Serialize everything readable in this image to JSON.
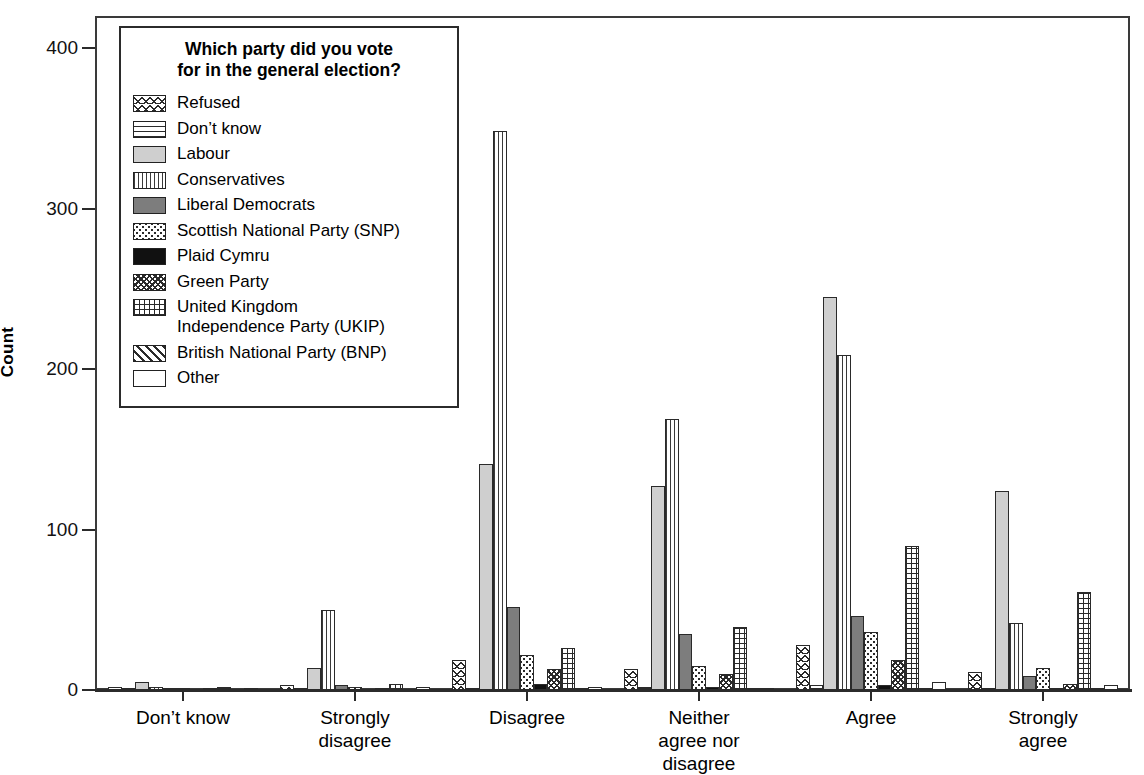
{
  "chart_data": {
    "type": "bar",
    "title": "",
    "xlabel": "",
    "ylabel": "Count",
    "ylim": [
      0,
      420
    ],
    "yticks": [
      0,
      100,
      200,
      300,
      400
    ],
    "grid": false,
    "legend_position": "inside-top-left",
    "legend_title": "Which party did you vote\nfor in the general election?",
    "categories": [
      "Don't know",
      "Strongly\ndisagree",
      "Disagree",
      "Neither\nagree nor\ndisagree",
      "Agree",
      "Strongly\nagree"
    ],
    "series": [
      {
        "name": "Refused",
        "pattern": "p-refused",
        "values": [
          2,
          3,
          19,
          13,
          28,
          11
        ]
      },
      {
        "name": "Don't know",
        "pattern": "p-dontknow",
        "values": [
          1,
          1,
          1,
          2,
          3,
          1
        ]
      },
      {
        "name": "Labour",
        "pattern": "p-labour",
        "values": [
          5,
          14,
          141,
          127,
          245,
          124
        ]
      },
      {
        "name": "Conservatives",
        "pattern": "p-cons",
        "values": [
          2,
          50,
          348,
          169,
          209,
          42
        ]
      },
      {
        "name": "Liberal Democrats",
        "pattern": "p-libdem",
        "values": [
          1,
          3,
          52,
          35,
          46,
          9
        ]
      },
      {
        "name": "Scottish National Party (SNP)",
        "pattern": "p-snp",
        "values": [
          1,
          2,
          22,
          15,
          36,
          14
        ]
      },
      {
        "name": "Plaid Cymru",
        "pattern": "p-plaid",
        "values": [
          0,
          0,
          4,
          2,
          3,
          1
        ]
      },
      {
        "name": "Green Party",
        "pattern": "p-green",
        "values": [
          1,
          1,
          13,
          10,
          19,
          4
        ]
      },
      {
        "name": "United Kingdom\nIndependence Party (UKIP)",
        "pattern": "p-ukip",
        "values": [
          2,
          4,
          26,
          39,
          90,
          61
        ]
      },
      {
        "name": "British National Party (BNP)",
        "pattern": "p-bnp",
        "values": [
          0,
          0,
          1,
          1,
          1,
          1
        ]
      },
      {
        "name": "Other",
        "pattern": "p-other",
        "values": [
          1,
          2,
          2,
          1,
          5,
          3
        ]
      }
    ]
  },
  "legend": {
    "title_line1": "Which party did you vote",
    "title_line2": "for in the general election?",
    "items": [
      {
        "label": "Refused",
        "label2": "",
        "swatch": "p-refused"
      },
      {
        "label": "Don’t know",
        "label2": "",
        "swatch": "p-dontknow"
      },
      {
        "label": "Labour",
        "label2": "",
        "swatch": "p-labour"
      },
      {
        "label": "Conservatives",
        "label2": "",
        "swatch": "p-cons"
      },
      {
        "label": "Liberal Democrats",
        "label2": "",
        "swatch": "p-libdem"
      },
      {
        "label": "Scottish National Party (SNP)",
        "label2": "",
        "swatch": "p-snp"
      },
      {
        "label": "Plaid Cymru",
        "label2": "",
        "swatch": "p-plaid"
      },
      {
        "label": "Green Party",
        "label2": "",
        "swatch": "p-green"
      },
      {
        "label": "United Kingdom",
        "label2": "Independence Party (UKIP)",
        "swatch": "p-ukip"
      },
      {
        "label": "British National Party (BNP)",
        "label2": "",
        "swatch": "p-bnp"
      },
      {
        "label": "Other",
        "label2": "",
        "swatch": "p-other"
      }
    ]
  },
  "axes": {
    "y_label": "Count",
    "y_ticks": [
      "400",
      "300",
      "200",
      "100",
      "0"
    ],
    "x_categories": [
      "Don’t know",
      "Strongly\ndisagree",
      "Disagree",
      "Neither\nagree nor\ndisagree",
      "Agree",
      "Strongly\nagree"
    ]
  },
  "colors": {
    "axis": "#2b2b2b",
    "fill_labour": "#cfcfcf",
    "fill_libdem": "#7d7d7d",
    "fill_plaid": "#111111",
    "background": "#ffffff"
  }
}
